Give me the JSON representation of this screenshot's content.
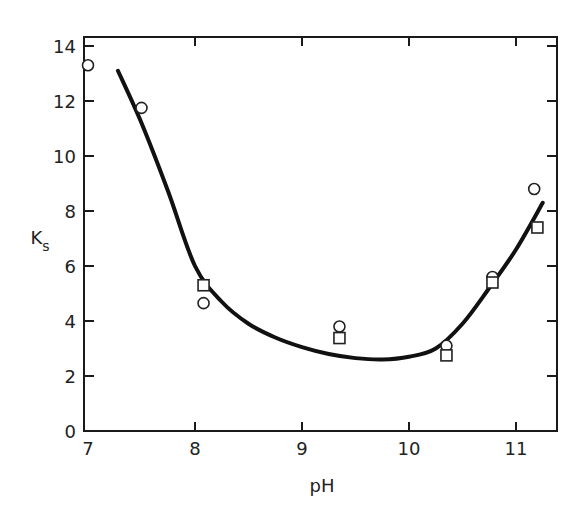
{
  "chart_data": {
    "type": "scatter",
    "title": "",
    "xlabel": "pH",
    "ylabel": "K",
    "ylabel_subscript": "s",
    "xlim": [
      7,
      11.4
    ],
    "ylim": [
      0,
      14.3
    ],
    "grid": false,
    "legend": null,
    "x_ticks": [
      7,
      8,
      9,
      10,
      11
    ],
    "x_tick_labels": [
      "7",
      "8",
      "9",
      "10",
      "11"
    ],
    "y_ticks": [
      0,
      2,
      4,
      6,
      8,
      10,
      12,
      14
    ],
    "y_tick_labels": [
      "0",
      "2",
      "4",
      "6",
      "8",
      "10",
      "12",
      "14"
    ],
    "series": [
      {
        "name": "circles",
        "marker": "circle",
        "x": [
          7.0,
          7.5,
          8.08,
          9.35,
          10.35,
          10.78,
          11.17
        ],
        "y": [
          13.3,
          11.75,
          4.65,
          3.8,
          3.1,
          5.6,
          8.8
        ]
      },
      {
        "name": "squares",
        "marker": "square",
        "x": [
          8.08,
          9.35,
          10.35,
          10.78,
          11.2
        ],
        "y": [
          5.3,
          3.38,
          2.75,
          5.4,
          7.4
        ]
      },
      {
        "name": "fitted curve",
        "marker": "line",
        "x": [
          7.28,
          7.5,
          7.75,
          8.0,
          8.25,
          8.5,
          8.75,
          9.0,
          9.25,
          9.5,
          9.75,
          10.0,
          10.25,
          10.5,
          10.75,
          11.0,
          11.25
        ],
        "y": [
          13.1,
          11.2,
          8.7,
          6.0,
          4.7,
          3.9,
          3.4,
          3.05,
          2.8,
          2.65,
          2.6,
          2.7,
          3.0,
          3.9,
          5.2,
          6.6,
          8.3
        ]
      }
    ]
  }
}
